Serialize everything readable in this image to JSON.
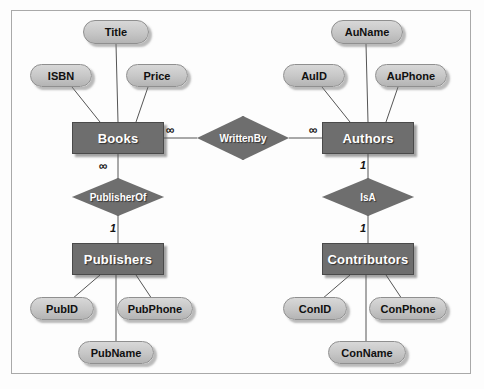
{
  "diagram": {
    "type": "entity-relationship",
    "colors": {
      "entity_fill": "#6e6e6e",
      "entity_text": "#ffffff",
      "attribute_fill": "#c6c6c6",
      "attribute_text": "#101010",
      "relationship_fill": "#6e6e6e",
      "relationship_text": "#ffffff",
      "line": "#555555",
      "frame_border": "#a9a9a9",
      "background": "#fdfdfd"
    }
  },
  "entities": [
    {
      "id": "books",
      "label": "Books",
      "x": 72,
      "y": 122,
      "w": 92,
      "h": 32
    },
    {
      "id": "authors",
      "label": "Authors",
      "x": 322,
      "y": 122,
      "w": 92,
      "h": 32
    },
    {
      "id": "publishers",
      "label": "Publishers",
      "x": 72,
      "y": 243,
      "w": 92,
      "h": 32
    },
    {
      "id": "contributors",
      "label": "Contributors",
      "x": 322,
      "y": 243,
      "w": 92,
      "h": 32
    }
  ],
  "attributes": [
    {
      "id": "title",
      "label": "Title",
      "entity": "books",
      "x": 83,
      "y": 20,
      "w": 66,
      "h": 24
    },
    {
      "id": "isbn",
      "label": "ISBN",
      "entity": "books",
      "x": 30,
      "y": 64,
      "w": 62,
      "h": 23
    },
    {
      "id": "price",
      "label": "Price",
      "entity": "books",
      "x": 126,
      "y": 64,
      "w": 62,
      "h": 23
    },
    {
      "id": "auname",
      "label": "AuName",
      "entity": "authors",
      "x": 331,
      "y": 20,
      "w": 72,
      "h": 24
    },
    {
      "id": "auid",
      "label": "AuID",
      "entity": "authors",
      "x": 283,
      "y": 64,
      "w": 62,
      "h": 23
    },
    {
      "id": "auphone",
      "label": "AuPhone",
      "entity": "authors",
      "x": 375,
      "y": 64,
      "w": 72,
      "h": 23
    },
    {
      "id": "pubid",
      "label": "PubID",
      "entity": "publishers",
      "x": 30,
      "y": 297,
      "w": 64,
      "h": 23
    },
    {
      "id": "pubphone",
      "label": "PubPhone",
      "entity": "publishers",
      "x": 117,
      "y": 297,
      "w": 76,
      "h": 23
    },
    {
      "id": "pubname",
      "label": "PubName",
      "entity": "publishers",
      "x": 78,
      "y": 341,
      "w": 76,
      "h": 23
    },
    {
      "id": "conid",
      "label": "ConID",
      "entity": "contributors",
      "x": 283,
      "y": 297,
      "w": 64,
      "h": 23
    },
    {
      "id": "conphone",
      "label": "ConPhone",
      "entity": "contributors",
      "x": 369,
      "y": 297,
      "w": 78,
      "h": 23
    },
    {
      "id": "conname",
      "label": "ConName",
      "entity": "contributors",
      "x": 328,
      "y": 341,
      "w": 78,
      "h": 23
    }
  ],
  "relationships": [
    {
      "id": "writtenby",
      "label": "WrittenBy",
      "from": "books",
      "to": "authors",
      "x": 197,
      "y": 116,
      "w": 92,
      "h": 44
    },
    {
      "id": "publisherof",
      "label": "PublisherOf",
      "from": "books",
      "to": "publishers",
      "x": 72,
      "y": 178,
      "w": 92,
      "h": 38
    },
    {
      "id": "isa",
      "label": "IsA",
      "from": "authors",
      "to": "contributors",
      "x": 322,
      "y": 178,
      "w": 92,
      "h": 38
    }
  ],
  "cardinalities": [
    {
      "id": "books-writtenby",
      "symbol": "∞",
      "x": 166,
      "y": 124
    },
    {
      "id": "authors-writtenby",
      "symbol": "∞",
      "x": 309,
      "y": 124
    },
    {
      "id": "books-publisherof",
      "symbol": "∞",
      "x": 99,
      "y": 160
    },
    {
      "id": "publishers-publisherof",
      "symbol": "1",
      "x": 110,
      "y": 223
    },
    {
      "id": "authors-isa",
      "symbol": "1",
      "x": 360,
      "y": 160
    },
    {
      "id": "contributors-isa",
      "symbol": "1",
      "x": 360,
      "y": 223
    }
  ],
  "connections": [
    {
      "id": "title-books",
      "x1": 116,
      "y1": 44,
      "x2": 118,
      "y2": 122
    },
    {
      "id": "isbn-books",
      "x1": 72,
      "y1": 87,
      "x2": 100,
      "y2": 122
    },
    {
      "id": "price-books",
      "x1": 148,
      "y1": 87,
      "x2": 136,
      "y2": 122
    },
    {
      "id": "auname-authors",
      "x1": 366,
      "y1": 44,
      "x2": 368,
      "y2": 122
    },
    {
      "id": "auid-authors",
      "x1": 322,
      "y1": 87,
      "x2": 350,
      "y2": 122
    },
    {
      "id": "auphone-authors",
      "x1": 398,
      "y1": 87,
      "x2": 386,
      "y2": 122
    },
    {
      "id": "books-rel-writtenby",
      "x1": 164,
      "y1": 138,
      "x2": 197,
      "y2": 138
    },
    {
      "id": "writtenby-authors",
      "x1": 289,
      "y1": 138,
      "x2": 322,
      "y2": 138
    },
    {
      "id": "books-publisherof",
      "x1": 118,
      "y1": 154,
      "x2": 118,
      "y2": 178
    },
    {
      "id": "publisherof-pubs",
      "x1": 118,
      "y1": 216,
      "x2": 118,
      "y2": 243
    },
    {
      "id": "authors-isa",
      "x1": 368,
      "y1": 154,
      "x2": 368,
      "y2": 178
    },
    {
      "id": "isa-contributors",
      "x1": 368,
      "y1": 216,
      "x2": 368,
      "y2": 243
    },
    {
      "id": "pubs-pubid",
      "x1": 100,
      "y1": 275,
      "x2": 72,
      "y2": 299
    },
    {
      "id": "pubs-pubphone",
      "x1": 136,
      "y1": 275,
      "x2": 152,
      "y2": 299
    },
    {
      "id": "pubs-pubname",
      "x1": 116,
      "y1": 275,
      "x2": 116,
      "y2": 341
    },
    {
      "id": "contrib-conid",
      "x1": 350,
      "y1": 275,
      "x2": 322,
      "y2": 299
    },
    {
      "id": "contrib-conphone",
      "x1": 386,
      "y1": 275,
      "x2": 402,
      "y2": 299
    },
    {
      "id": "contrib-conname",
      "x1": 366,
      "y1": 275,
      "x2": 366,
      "y2": 341
    }
  ]
}
